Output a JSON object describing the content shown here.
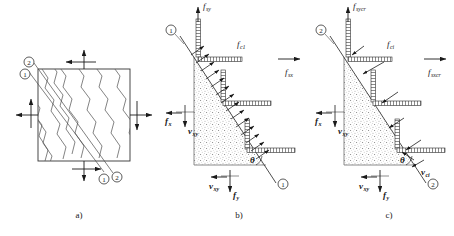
{
  "figure": {
    "panels": [
      {
        "id": "a",
        "caption": "a)",
        "description": "Cracked membrane element with principal axes"
      },
      {
        "id": "b",
        "caption": "b)",
        "description": "Average stresses on free body cut along crack"
      },
      {
        "id": "c",
        "caption": "c)",
        "description": "Local stresses at a crack"
      }
    ]
  },
  "colors": {
    "line": "#1a1a1a",
    "crack": "#555555",
    "stipple": "#8a8a8a",
    "background": "#ffffff",
    "hatch": "#333333"
  },
  "panel_a": {
    "caption": "a)",
    "axis_labels": [
      {
        "name": "axis-2-top",
        "text": "2"
      },
      {
        "name": "axis-1-top",
        "text": "1"
      },
      {
        "name": "axis-1-bottom",
        "text": "1"
      },
      {
        "name": "axis-2-bottom",
        "text": "2"
      }
    ],
    "crack_count": 10,
    "edge_arrows": [
      "top-up",
      "top-left",
      "left-left",
      "left-up",
      "right-right",
      "right-down",
      "bottom-down",
      "bottom-right"
    ]
  },
  "panel_b": {
    "caption": "b)",
    "crack_labels": [
      {
        "name": "crack-marker-top",
        "text": "1"
      },
      {
        "name": "crack-marker-bottom",
        "text": "1"
      }
    ],
    "angle_label": "θ",
    "stresses": [
      {
        "name": "f-sy",
        "base": "f",
        "sub": "sy",
        "direction": "up",
        "position": "top"
      },
      {
        "name": "f-c1",
        "base": "f",
        "sub": "c1",
        "direction": "diagonal-up-right",
        "position": "interior"
      },
      {
        "name": "f-sx",
        "base": "f",
        "sub": "sx",
        "direction": "right",
        "position": "right"
      },
      {
        "name": "f-x",
        "base": "f",
        "sub": "x",
        "direction": "left",
        "position": "left"
      },
      {
        "name": "v-xy-left",
        "base": "v",
        "sub": "xy",
        "direction": "down",
        "position": "left"
      },
      {
        "name": "v-xy-bottom",
        "base": "v",
        "sub": "xy",
        "direction": "left",
        "position": "bottom"
      },
      {
        "name": "f-y",
        "base": "f",
        "sub": "y",
        "direction": "down",
        "position": "bottom"
      }
    ]
  },
  "panel_c": {
    "caption": "c)",
    "crack_labels": [
      {
        "name": "crack-marker-top",
        "text": "2"
      },
      {
        "name": "crack-marker-bottom",
        "text": "2"
      }
    ],
    "angle_label": "θ",
    "stresses": [
      {
        "name": "f-sycr",
        "base": "f",
        "sub": "sycr",
        "direction": "up",
        "position": "top"
      },
      {
        "name": "f-ci",
        "base": "f",
        "sub": "ci",
        "direction": "diagonal-up-right",
        "position": "interior"
      },
      {
        "name": "f-sxcr",
        "base": "f",
        "sub": "sxcr",
        "direction": "right",
        "position": "right"
      },
      {
        "name": "f-x",
        "base": "f",
        "sub": "x",
        "direction": "left",
        "position": "left"
      },
      {
        "name": "v-xy-left",
        "base": "v",
        "sub": "xy",
        "direction": "down",
        "position": "left"
      },
      {
        "name": "v-xy-bottom",
        "base": "v",
        "sub": "xy",
        "direction": "left",
        "position": "bottom"
      },
      {
        "name": "f-y",
        "base": "f",
        "sub": "y",
        "direction": "down",
        "position": "bottom"
      },
      {
        "name": "v-ci",
        "base": "v",
        "sub": "ci",
        "direction": "down-right",
        "position": "crack"
      }
    ]
  }
}
